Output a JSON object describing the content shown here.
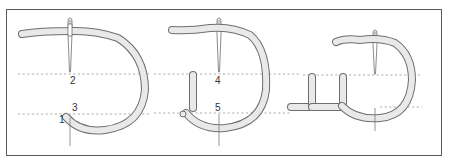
{
  "figure": {
    "colors": {
      "border": "#5a5a5a",
      "thread_fill": "#e9e9e9",
      "thread_outline": "#6e6e6e",
      "guide_line": "#9a9a9a",
      "label": "#333333"
    },
    "panels": [
      {
        "id": "step-1",
        "labels": [
          {
            "text": "2",
            "x": 70,
            "y": 82
          },
          {
            "text": "3",
            "x": 72,
            "y": 110
          },
          {
            "text": "1",
            "x": 59,
            "y": 120
          }
        ]
      },
      {
        "id": "step-2",
        "labels": [
          {
            "text": "4",
            "x": 218,
            "y": 82
          },
          {
            "text": "5",
            "x": 218,
            "y": 110
          }
        ]
      },
      {
        "id": "step-3",
        "labels": []
      }
    ]
  }
}
